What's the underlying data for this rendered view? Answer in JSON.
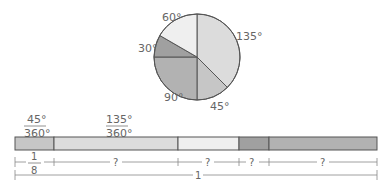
{
  "pie": {
    "slices": [
      {
        "label": "135°",
        "degrees": 135,
        "color": "#dcdcdc"
      },
      {
        "label": "45°",
        "degrees": 45,
        "color": "#c8c8c8"
      },
      {
        "label": "90°",
        "degrees": 90,
        "color": "#b4b4b4"
      },
      {
        "label": "30°",
        "degrees": 30,
        "color": "#a2a2a2"
      },
      {
        "label": "60°",
        "degrees": 60,
        "color": "#efefef"
      }
    ]
  },
  "bar": {
    "fractions": [
      {
        "num": "45°",
        "den": "360°"
      },
      {
        "num": "135°",
        "den": "360°"
      }
    ],
    "segments": [
      "45°",
      "135°",
      "60°",
      "30°",
      "90°"
    ]
  },
  "measure": {
    "first_num": "1",
    "first_den": "8",
    "unknown": "?",
    "total": "1"
  }
}
